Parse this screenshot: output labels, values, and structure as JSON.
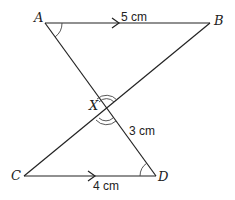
{
  "diagram": {
    "points": {
      "A": {
        "label": "A",
        "x": 45,
        "y": 23
      },
      "B": {
        "label": "B",
        "x": 210,
        "y": 23
      },
      "X": {
        "label": "X",
        "x": 106,
        "y": 110
      },
      "C": {
        "label": "C",
        "x": 24,
        "y": 176
      },
      "D": {
        "label": "D",
        "x": 156,
        "y": 176
      }
    },
    "segments": [
      {
        "from": "A",
        "to": "B",
        "parallel_arrow": true
      },
      {
        "from": "A",
        "to": "D"
      },
      {
        "from": "C",
        "to": "B"
      },
      {
        "from": "C",
        "to": "D",
        "parallel_arrow": true
      }
    ],
    "lengths": {
      "AB": "5 cm",
      "XD": "3 cm",
      "CD": "4 cm"
    },
    "angle_marks": {
      "A": "single arc",
      "D": "single arc",
      "X": "double arc (vertically opposite angles)"
    }
  }
}
